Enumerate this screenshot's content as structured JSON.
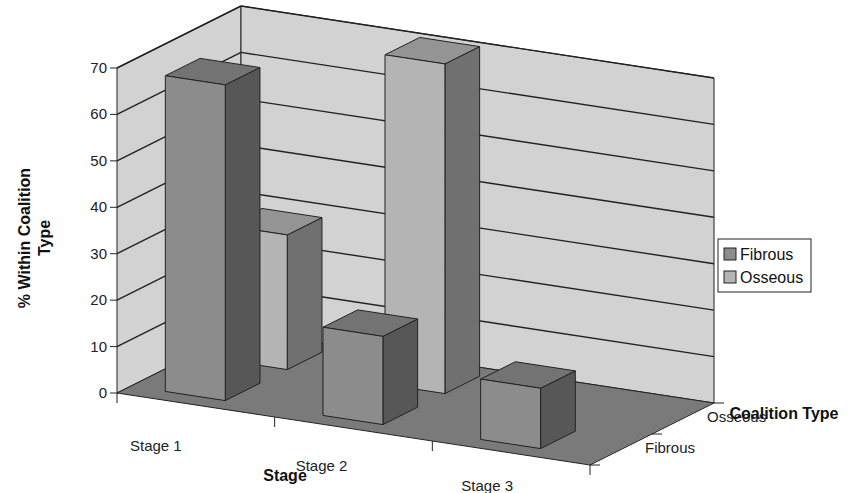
{
  "chart_data": {
    "type": "bar",
    "subtype": "3d-column",
    "title": "",
    "categories": [
      "Stage 1",
      "Stage 2",
      "Stage 3"
    ],
    "series": [
      {
        "name": "Fibrous",
        "values": [
          68,
          19,
          13
        ]
      },
      {
        "name": "Osseous",
        "values": [
          29,
          71,
          0
        ]
      }
    ],
    "depth_categories": [
      "Fibrous",
      "Osseous"
    ],
    "xlabel": "Stage",
    "ylabel": "% Within Coalition Type",
    "zlabel": "Coalition Type",
    "ylim": [
      0,
      70
    ],
    "yticks": [
      0,
      10,
      20,
      30,
      40,
      50,
      60,
      70
    ],
    "grid": true,
    "legend": {
      "position": "right",
      "entries": [
        "Fibrous",
        "Osseous"
      ]
    },
    "colors": {
      "Fibrous": "#8c8c8c",
      "Osseous": "#b4b4b4",
      "walls": "#d2d2d2",
      "floor": "#7a7a7a"
    }
  }
}
